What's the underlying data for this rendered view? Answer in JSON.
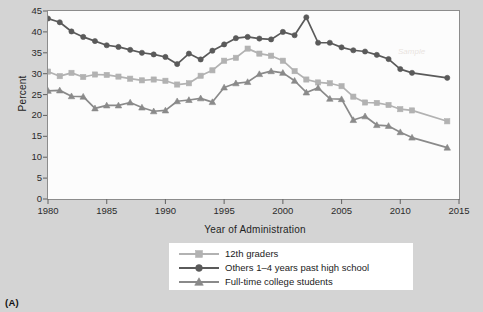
{
  "figure": {
    "panel_label": "(A)",
    "background_color": "#d4d4d4",
    "plot_background_color": "#fcfcfc",
    "watermark_text": "Sample"
  },
  "chart_data": {
    "type": "line",
    "title": "",
    "xlabel": "Year of Administration",
    "ylabel": "Percent",
    "xlim": [
      1980,
      2015
    ],
    "ylim": [
      0,
      45
    ],
    "xticks": [
      1980,
      1985,
      1990,
      1995,
      2000,
      2005,
      2010,
      2015
    ],
    "yticks": [
      0,
      5,
      10,
      15,
      20,
      25,
      30,
      35,
      40,
      45
    ],
    "grid": false,
    "legend_position": "below-axes",
    "x": [
      1980,
      1981,
      1982,
      1983,
      1984,
      1985,
      1986,
      1987,
      1988,
      1989,
      1990,
      1991,
      1992,
      1993,
      1994,
      1995,
      1996,
      1997,
      1998,
      1999,
      2000,
      2001,
      2002,
      2003,
      2004,
      2005,
      2006,
      2007,
      2008,
      2009,
      2010,
      2011,
      2014
    ],
    "series": [
      {
        "name": "12th graders",
        "color": "#b2b2b2",
        "marker": "square",
        "values": [
          30.5,
          29.4,
          30.2,
          29.2,
          29.8,
          29.7,
          29.3,
          28.8,
          28.4,
          28.6,
          28.3,
          27.4,
          27.7,
          29.5,
          30.8,
          33.1,
          33.8,
          36.0,
          34.8,
          34.3,
          33.1,
          30.6,
          28.6,
          27.9,
          27.7,
          27.0,
          24.5,
          23.1,
          23.0,
          22.5,
          21.5,
          21.2,
          18.6
        ]
      },
      {
        "name": "Others 1–4 years past high school",
        "color": "#5a5a5a",
        "marker": "circle",
        "values": [
          43.2,
          42.3,
          40.1,
          38.8,
          37.8,
          36.8,
          36.4,
          35.7,
          35.0,
          34.6,
          34.0,
          32.3,
          34.8,
          33.4,
          35.5,
          37.0,
          38.5,
          38.8,
          38.4,
          38.2,
          40.0,
          39.2,
          43.5,
          37.4,
          37.4,
          36.3,
          35.6,
          35.3,
          34.5,
          33.5,
          31.1,
          30.2,
          29.0
        ]
      },
      {
        "name": "Full-time college students",
        "color": "#8a8a8a",
        "marker": "triangle",
        "values": [
          25.9,
          26.0,
          24.6,
          24.5,
          21.7,
          22.4,
          22.4,
          23.1,
          21.9,
          21.0,
          21.2,
          23.4,
          23.7,
          24.1,
          23.2,
          26.7,
          27.7,
          28.0,
          29.9,
          30.6,
          30.2,
          28.3,
          25.5,
          26.6,
          24.0,
          23.9,
          18.9,
          19.8,
          17.7,
          17.5,
          16.0,
          14.7,
          12.3
        ]
      }
    ],
    "series_endpoints_2014": [
      12.9,
      23.7,
      12.3
    ]
  },
  "legend": {
    "items": [
      {
        "label": "12th graders",
        "symbol": "square-marker",
        "color": "#b2b2b2"
      },
      {
        "label": "Others 1–4 years past high school",
        "symbol": "circle-marker",
        "color": "#5a5a5a"
      },
      {
        "label": "Full-time college students",
        "symbol": "triangle-marker",
        "color": "#8a8a8a"
      }
    ]
  }
}
